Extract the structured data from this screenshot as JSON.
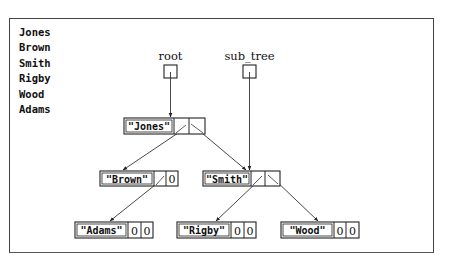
{
  "output_lines": [
    "Jones",
    "Brown",
    "Smith",
    "Rigby",
    "Wood",
    "Adams"
  ],
  "pointers": {
    "root": {
      "label": "root"
    },
    "sub_tree": {
      "label": "sub_tree"
    }
  },
  "nodes": {
    "jones": {
      "value": "\"Jones\"",
      "left": "ptr",
      "right": "ptr"
    },
    "brown": {
      "value": "\"Brown\"",
      "left": "ptr",
      "right": "0"
    },
    "smith": {
      "value": "\"Smith\"",
      "left": "ptr",
      "right": "ptr"
    },
    "adams": {
      "value": "\"Adams\"",
      "left": "0",
      "right": "0"
    },
    "rigby": {
      "value": "\"Rigby\"",
      "left": "0",
      "right": "0"
    },
    "wood": {
      "value": "\"Wood\"",
      "left": "0",
      "right": "0"
    }
  },
  "edges": [
    {
      "from": "root",
      "to": "jones"
    },
    {
      "from": "sub_tree",
      "to": "smith"
    },
    {
      "from": "jones.left",
      "to": "brown"
    },
    {
      "from": "jones.right",
      "to": "smith"
    },
    {
      "from": "brown.left",
      "to": "adams"
    },
    {
      "from": "smith.left",
      "to": "rigby"
    },
    {
      "from": "smith.right",
      "to": "wood"
    }
  ]
}
